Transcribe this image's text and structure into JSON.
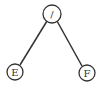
{
  "diagram": {
    "type": "tree",
    "nodes": [
      {
        "id": "root",
        "label": "/",
        "cx": 52,
        "cy": 14,
        "r": 9
      },
      {
        "id": "left",
        "label": "E",
        "cx": 15,
        "cy": 72,
        "r": 8
      },
      {
        "id": "right",
        "label": "F",
        "cx": 87,
        "cy": 73,
        "r": 8
      }
    ],
    "edges": [
      {
        "from": "root",
        "to": "left"
      },
      {
        "from": "root",
        "to": "right"
      }
    ]
  }
}
